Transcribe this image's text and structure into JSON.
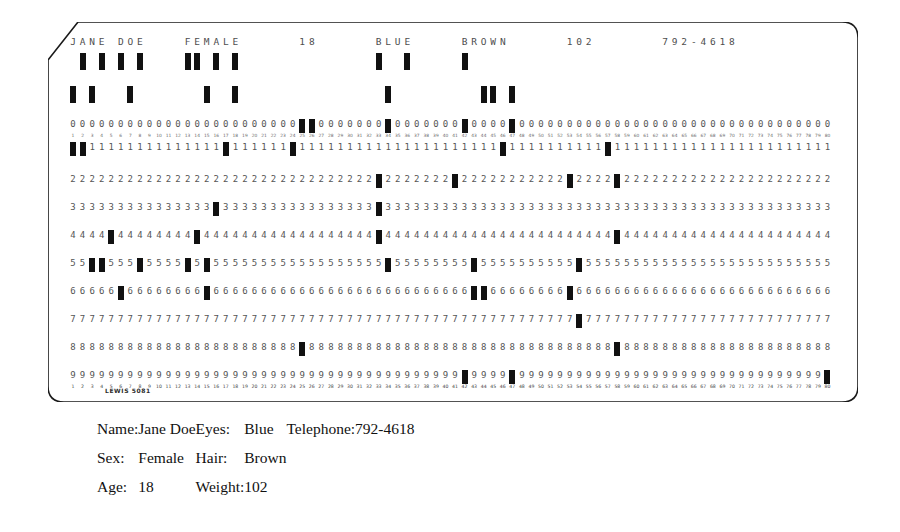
{
  "card": {
    "maker_mark": "LEWIS 5081",
    "columns": 80,
    "printed_line": "JANE DOE   FEMALE    18   BLUE   BROWN   102   792-4618",
    "printed_fields": [
      {
        "text": "JANE DOE",
        "start_col": 1
      },
      {
        "text": "FEMALE",
        "start_col": 13
      },
      {
        "text": "18",
        "start_col": 25
      },
      {
        "text": "BLUE",
        "start_col": 33
      },
      {
        "text": "BROWN",
        "start_col": 42
      },
      {
        "text": "102",
        "start_col": 53
      },
      {
        "text": "792-4618",
        "start_col": 63
      }
    ],
    "row_labels": [
      "12",
      "11",
      "0",
      "1",
      "2",
      "3",
      "4",
      "5",
      "6",
      "7",
      "8",
      "9"
    ],
    "digit_rows": [
      "0",
      "1",
      "2",
      "3",
      "4",
      "5",
      "6",
      "7",
      "8",
      "9"
    ],
    "punches": {
      "12": [
        2,
        4,
        6,
        8,
        13,
        14,
        16,
        18,
        33,
        36,
        42
      ],
      "11": [
        1,
        3,
        7,
        15,
        18,
        34,
        44,
        45,
        47
      ],
      "0": [
        25,
        26,
        34,
        42,
        47
      ],
      "1": [
        1,
        2,
        17,
        24,
        46,
        57
      ],
      "2": [
        33,
        41,
        53,
        58
      ],
      "3": [
        16,
        33
      ],
      "4": [
        5,
        14,
        33,
        58
      ],
      "5": [
        3,
        4,
        8,
        13,
        15,
        34,
        43,
        54
      ],
      "6": [
        6,
        15,
        43,
        44,
        53
      ],
      "7": [
        54
      ],
      "8": [
        25,
        58
      ],
      "9": [
        42,
        47,
        80
      ]
    }
  },
  "caption": {
    "rows": [
      {
        "label1": "Name:",
        "value1": "Jane Doe",
        "label2": "Eyes:",
        "value2": "Blue",
        "label3": "Telephone:",
        "value3": "792-4618"
      },
      {
        "label1": "Sex:",
        "value1": "Female",
        "label2": "Hair:",
        "value2": "Brown",
        "label3": "",
        "value3": ""
      },
      {
        "label1": "Age:",
        "value1": "18",
        "label2": "Weight:",
        "value2": "102",
        "label3": "",
        "value3": ""
      }
    ]
  },
  "colors": {
    "ink": "#111111",
    "card_stroke": "#1a1a1a",
    "ghost_digit": "#555555",
    "paper": "#ffffff"
  }
}
